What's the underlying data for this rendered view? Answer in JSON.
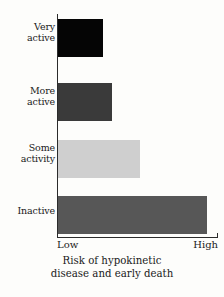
{
  "chart_data": {
    "type": "bar",
    "orientation": "horizontal",
    "title": "",
    "subtitle": "",
    "xlabel": "Risk of hypokinetic disease and early death",
    "ylabel": "",
    "categories": [
      "Very active",
      "More active",
      "Some activity",
      "Inactive"
    ],
    "values": [
      28,
      34,
      51,
      93
    ],
    "xlim": [
      0,
      100
    ],
    "xtick_labels": [
      "Low",
      "High"
    ],
    "xtick_values": [
      0,
      100
    ],
    "grid": false,
    "legend": false,
    "bar_colors": [
      "#050505",
      "#3a3a3a",
      "#cfcfcf",
      "#575757"
    ],
    "bars": [
      {
        "category_line1": "Very",
        "category_line2": "active",
        "value": 28,
        "color": "#050505"
      },
      {
        "category_line1": "More",
        "category_line2": "active",
        "value": 34,
        "color": "#3a3a3a"
      },
      {
        "category_line1": "Some",
        "category_line2": "activity",
        "value": 51,
        "color": "#cfcfcf"
      },
      {
        "category_line1": "Inactive",
        "category_line2": "",
        "value": 93,
        "color": "#575757"
      }
    ]
  },
  "axis": {
    "low_label": "Low",
    "high_label": "High"
  },
  "caption": {
    "line1": "Risk of hypokinetic",
    "line2": "disease and early death"
  },
  "colors": {
    "axis": "#2b2b2b",
    "text": "#1a1a1a",
    "background": "#fdfdfb"
  }
}
